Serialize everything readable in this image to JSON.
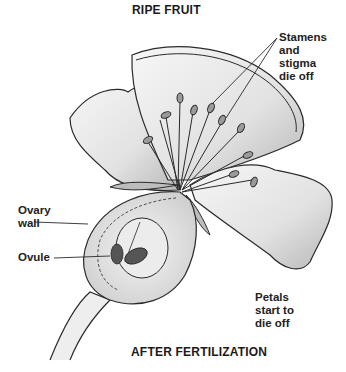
{
  "diagram": {
    "top_title": "RIPE FRUIT",
    "bottom_title": "AFTER FERTILIZATION",
    "labels": {
      "stamens": "Stamens\nand\nstigma\ndie off",
      "ovary_wall": "Ovary\nwall",
      "ovule": "Ovule",
      "petals": "Petals\nstart to\ndie off"
    },
    "colors": {
      "line": "#2a2a2a",
      "petal_fill": "#ececec",
      "petal_shade": "#bdbdbd",
      "stamen_fill": "#9a9a9a",
      "ovule_fill": "#555555"
    }
  }
}
